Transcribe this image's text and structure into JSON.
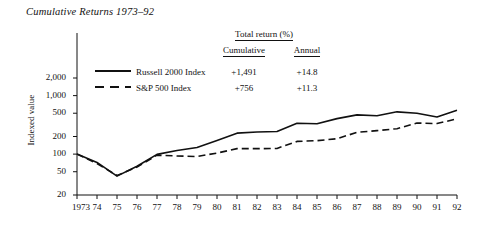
{
  "chart_data": {
    "type": "line",
    "title": "Cumulative Returns 1973–92",
    "xlabel": "",
    "ylabel": "Indexed value",
    "yscale": "log",
    "ylim": [
      20,
      2600
    ],
    "yticks": [
      20,
      50,
      100,
      200,
      500,
      1000,
      2000
    ],
    "ytick_labels": [
      "20",
      "50",
      "100",
      "200",
      "500",
      "1,000",
      "2,000"
    ],
    "x": [
      1973,
      1974,
      1975,
      1976,
      1977,
      1978,
      1979,
      1980,
      1981,
      1982,
      1983,
      1984,
      1985,
      1986,
      1987,
      1988,
      1989,
      1990,
      1991,
      1992
    ],
    "xtick_labels": [
      "1973",
      "74",
      "75",
      "76",
      "77",
      "78",
      "79",
      "80",
      "81",
      "82",
      "83",
      "84",
      "85",
      "86",
      "87",
      "88",
      "89",
      "90",
      "91",
      "92"
    ],
    "grid": false,
    "legend_position": "upper-left-inside",
    "series": [
      {
        "name": "Russell 2000 Index",
        "style": "solid",
        "color": "#111111",
        "values": [
          100,
          72,
          42,
          62,
          99,
          115,
          130,
          171,
          228,
          239,
          243,
          337,
          330,
          404,
          468,
          452,
          528,
          500,
          430,
          560
        ]
      },
      {
        "name": "S&P 500 Index",
        "style": "dashed",
        "color": "#111111",
        "values": [
          100,
          69,
          43,
          60,
          96,
          93,
          91,
          104,
          124,
          124,
          125,
          165,
          170,
          183,
          236,
          252,
          272,
          340,
          333,
          400
        ]
      }
    ]
  },
  "legend": {
    "header": "Total return (%)",
    "columns": [
      "Cumulative",
      "Annual"
    ],
    "rows": [
      {
        "label": "Russell 2000 Index",
        "style": "solid",
        "cumulative": "+1,491",
        "annual": "+14.8"
      },
      {
        "label": "S&P 500 Index",
        "style": "dashed",
        "cumulative": "+756",
        "annual": "+11.3"
      }
    ]
  }
}
